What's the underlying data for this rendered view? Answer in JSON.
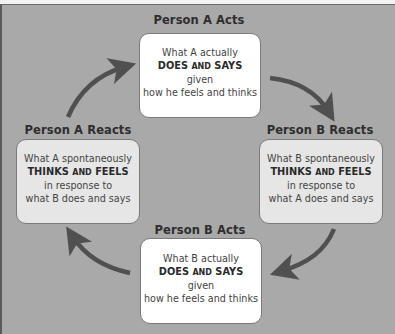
{
  "diagram": {
    "type": "cycle",
    "colors": {
      "background": "#a9a9a9",
      "acts_box": "#ffffff",
      "reacts_box": "#e6e6e6",
      "arrow": "#505050",
      "title_text": "#2e2e2e",
      "body_text": "#444444"
    },
    "nodes": [
      {
        "id": "a-acts",
        "title": "Person A Acts",
        "line1": "What A actually",
        "strong_a": "DOES",
        "strong_b": "AND",
        "strong_c": "SAYS",
        "line3": "given",
        "line4": "how he feels and thinks"
      },
      {
        "id": "b-reacts",
        "title": "Person B Reacts",
        "line1": "What B spontaneously",
        "strong_a": "THINKS",
        "strong_b": "AND",
        "strong_c": "FEELS",
        "line3": "in response to",
        "line4": "what A does and says"
      },
      {
        "id": "b-acts",
        "title": "Person B Acts",
        "line1": "What B actually",
        "strong_a": "DOES",
        "strong_b": "AND",
        "strong_c": "SAYS",
        "line3": "given",
        "line4": "how he feels and thinks"
      },
      {
        "id": "a-reacts",
        "title": "Person A Reacts",
        "line1": "What A spontaneously",
        "strong_a": "THINKS",
        "strong_b": "AND",
        "strong_c": "FEELS",
        "line3": "in response to",
        "line4": "what B does and says"
      }
    ],
    "edges": [
      {
        "from": "a-acts",
        "to": "b-reacts"
      },
      {
        "from": "b-reacts",
        "to": "b-acts"
      },
      {
        "from": "b-acts",
        "to": "a-reacts"
      },
      {
        "from": "a-reacts",
        "to": "a-acts"
      }
    ]
  }
}
